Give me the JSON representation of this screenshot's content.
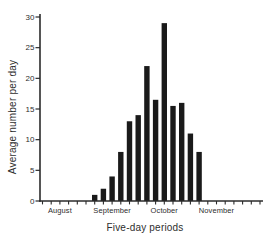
{
  "chart_data": {
    "type": "bar",
    "title": "",
    "xlabel": "Five-day periods",
    "ylabel": "Average number per day",
    "ylim": [
      0,
      30
    ],
    "y_ticks": [
      0,
      5,
      10,
      15,
      20,
      25,
      30
    ],
    "grid": false,
    "legend": false,
    "num_periods": 26,
    "month_labels": [
      {
        "label": "August",
        "period_index": 2
      },
      {
        "label": "September",
        "period_index": 8
      },
      {
        "label": "October",
        "period_index": 14
      },
      {
        "label": "November",
        "period_index": 20
      }
    ],
    "bars": {
      "start_period_index": 6,
      "values": [
        1,
        2,
        4,
        8,
        13,
        14,
        22,
        16.5,
        29,
        15.5,
        16,
        11,
        8
      ]
    },
    "bar_color": "#1a1a1a",
    "axis_color": "#2b2b2b"
  }
}
